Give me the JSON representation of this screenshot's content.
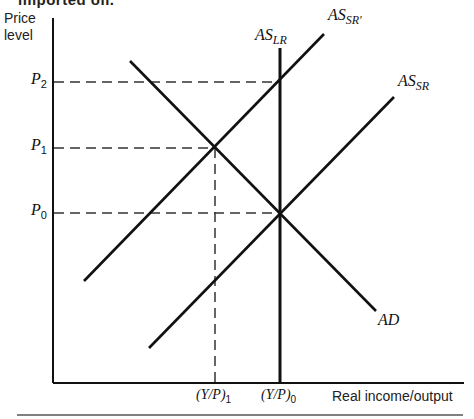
{
  "caption_fragment": "imported oil.",
  "axes": {
    "y_title_line1": "Price",
    "y_title_line2": "level",
    "x_title": "Real income/output"
  },
  "price_levels": [
    {
      "symbol": "P",
      "sub": "2",
      "y": 82
    },
    {
      "symbol": "P",
      "sub": "1",
      "y": 148
    },
    {
      "symbol": "P",
      "sub": "0",
      "y": 213
    }
  ],
  "output_levels": [
    {
      "symbol": "(Y/P)",
      "sub": "1",
      "x": 215
    },
    {
      "symbol": "(Y/P)",
      "sub": "0",
      "x": 280
    }
  ],
  "curves": {
    "as_lr": {
      "base": "AS",
      "sub": "LR"
    },
    "as_sr_prime": {
      "base": "AS",
      "sub": "SR'"
    },
    "as_sr": {
      "base": "AS",
      "sub": "SR"
    },
    "ad": {
      "base": "AD",
      "sub": ""
    }
  },
  "colors": {
    "ink": "#111111",
    "dash": "#333333",
    "background": "#ffffff"
  }
}
